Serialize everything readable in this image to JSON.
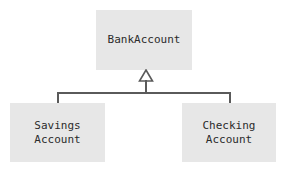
{
  "diagram": {
    "type": "uml-class-diagram",
    "relationship": "generalization",
    "colors": {
      "box_fill": "#e7e7e7",
      "line": "#5a5a5a",
      "text": "#2b2b2b",
      "background": "#ffffff"
    },
    "superclass": {
      "name": "BankAccount",
      "label": "BankAccount"
    },
    "subclasses": [
      {
        "name": "SavingsAccount",
        "label": "Savings\nAccount"
      },
      {
        "name": "CheckingAccount",
        "label": "Checking\nAccount"
      }
    ],
    "arrow": {
      "kind": "hollow-triangle",
      "direction": "up",
      "points_to": "BankAccount"
    }
  }
}
